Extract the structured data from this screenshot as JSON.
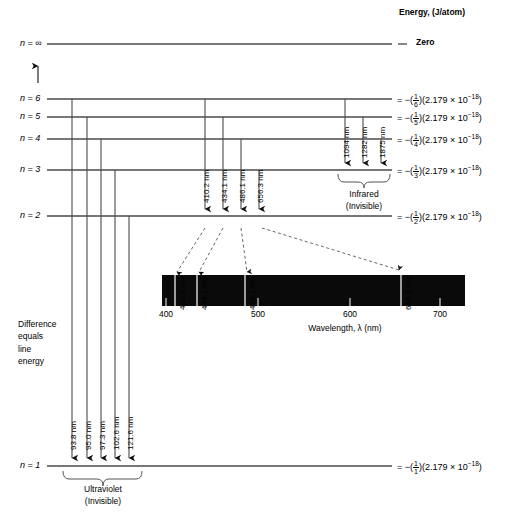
{
  "header": {
    "energy_axis_label": "Energy, (J/atom)",
    "zero_label": "Zero",
    "zero_equals": "="
  },
  "levels": [
    {
      "name": "n = ∞",
      "n": "∞",
      "y": 44,
      "energy_text": "Zero",
      "denominator": null
    },
    {
      "name": "n = 6",
      "n": "6",
      "y": 99,
      "energy_text": "= −(1/6²)(2.179 × 10⁻¹⁸)",
      "denominator": "6"
    },
    {
      "name": "n = 5",
      "n": "5",
      "y": 117,
      "energy_text": "= −(1/5²)(2.179 × 10⁻¹⁸)",
      "denominator": "5"
    },
    {
      "name": "n = 4",
      "n": "4",
      "y": 139,
      "energy_text": "= −(1/4²)(2.179 × 10⁻¹⁸)",
      "denominator": "4"
    },
    {
      "name": "n = 3",
      "n": "3",
      "y": 170,
      "energy_text": "= −(1/3²)(2.179 × 10⁻¹⁸)",
      "denominator": "3"
    },
    {
      "name": "n = 2",
      "n": "2",
      "y": 216,
      "energy_text": "= −(1/2²)(2.179 × 10⁻¹⁸)",
      "denominator": "2"
    },
    {
      "name": "n = 1",
      "n": "1",
      "y": 466,
      "energy_text": "= −(1/1²)(2.179 × 10⁻¹⁸)",
      "denominator": "1"
    }
  ],
  "energy_formula": {
    "equals": "=",
    "minus": "−",
    "open_paren": "(",
    "close_paren": ")",
    "numerator": "1",
    "constant": "(2.179 × 10",
    "exponent": "−18",
    "tail": ")"
  },
  "series": {
    "lyman": {
      "name": "Ultraviolet",
      "visibility": "(Invisible)",
      "target_level": "n = 1",
      "lines": [
        {
          "wavelength": "93.8 nm",
          "from": "n = 6",
          "x": 72
        },
        {
          "wavelength": "95.0 nm",
          "from": "n = 5",
          "x": 87
        },
        {
          "wavelength": "97.3 nm",
          "from": "n = 4",
          "x": 101
        },
        {
          "wavelength": "102.6 nm",
          "from": "n = 3",
          "x": 115
        },
        {
          "wavelength": "121.6 nm",
          "from": "n = 2",
          "x": 129
        }
      ]
    },
    "balmer": {
      "name": "Visible",
      "target_level": "n = 2",
      "lines": [
        {
          "wavelength": "410.2 nm",
          "from": "n = 6",
          "x": 205,
          "band_x": 175
        },
        {
          "wavelength": "434.1 nm",
          "from": "n = 5",
          "x": 223,
          "band_x": 197
        },
        {
          "wavelength": "486.1 nm",
          "from": "n = 4",
          "x": 241,
          "band_x": 245
        },
        {
          "wavelength": "656.3 nm",
          "from": "n = 3",
          "x": 259,
          "band_x": 401
        }
      ]
    },
    "paschen": {
      "name": "Infrared",
      "visibility": "(Invisible)",
      "target_level": "n = 3",
      "lines": [
        {
          "wavelength": "1094 nm",
          "from": "n = 6",
          "x": 345
        },
        {
          "wavelength": "1282 nm",
          "from": "n = 5",
          "x": 363
        },
        {
          "wavelength": "1875 nm",
          "from": "n = 4",
          "x": 381
        }
      ]
    }
  },
  "spectrum": {
    "axis_label": "Wavelength, λ (nm)",
    "band_color": "#0a0a0a",
    "line_color": "#ffffff",
    "ticks": [
      {
        "label": "400",
        "x": 166
      },
      {
        "label": "500",
        "x": 258
      },
      {
        "label": "600",
        "x": 350
      },
      {
        "label": "700",
        "x": 440
      }
    ],
    "emission_lines": [
      {
        "wavelength": "410.2 nm",
        "x": 175
      },
      {
        "wavelength": "434.1 nm",
        "x": 197
      },
      {
        "wavelength": "486.1 nm",
        "x": 245
      },
      {
        "wavelength": "656.3 nm",
        "x": 401
      }
    ]
  },
  "annotations": {
    "difference_note": "Difference\nequals\nline\nenergy",
    "difference_lines": [
      "Difference",
      "equals",
      "line",
      "energy"
    ],
    "up_arrow": "↑"
  }
}
